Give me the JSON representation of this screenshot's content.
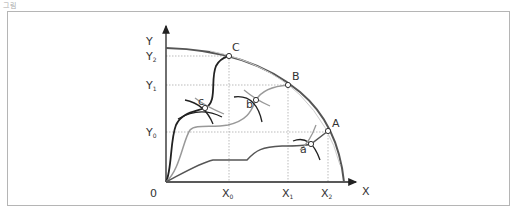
{
  "caption": "그림",
  "axes": {
    "y_label": "Y",
    "x_label": "X",
    "origin": "0",
    "x_ticks": [
      {
        "base": "X",
        "sub": "0"
      },
      {
        "base": "X",
        "sub": "1"
      },
      {
        "base": "X",
        "sub": "2"
      }
    ],
    "y_ticks": [
      {
        "base": "Y",
        "sub": "2"
      },
      {
        "base": "Y",
        "sub": "1"
      },
      {
        "base": "Y",
        "sub": "0"
      }
    ]
  },
  "points": {
    "frontier": [
      "C",
      "B",
      "A"
    ],
    "interior": [
      "c",
      "b",
      "a"
    ]
  },
  "colors": {
    "frontier": "#555555",
    "dark_path": "#222222",
    "gray_path": "#999999",
    "mid_path": "#555555",
    "guide": "#aaaaaa"
  }
}
